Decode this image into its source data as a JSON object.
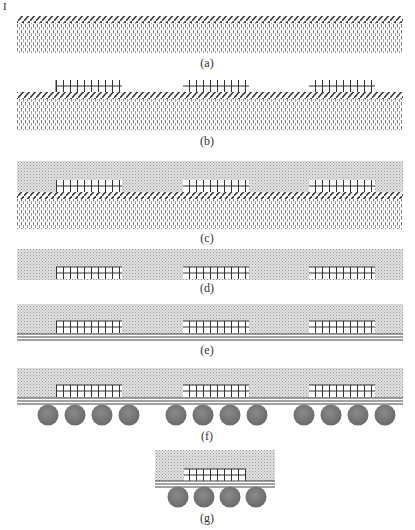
{
  "page_marker": "I",
  "diagram": {
    "type": "process-flow",
    "colors": {
      "hatch": "#3a3a3a",
      "dots": "#8a8a8a",
      "stipple_bg": "#d8d8d8",
      "chip_grid": "#333333",
      "rdl": "#444444",
      "solder_ball": "#777777"
    },
    "panels": [
      {
        "id": "a",
        "label": "(a)",
        "layers": [
          "carrier",
          "adhesive-tape"
        ]
      },
      {
        "id": "b",
        "label": "(b)",
        "layers": [
          "carrier",
          "adhesive-tape",
          "dies"
        ],
        "die_count": 3
      },
      {
        "id": "c",
        "label": "(c)",
        "layers": [
          "carrier",
          "adhesive-tape",
          "dies",
          "mold-compound"
        ],
        "die_count": 3
      },
      {
        "id": "d",
        "label": "(d)",
        "layers": [
          "reconstituted-wafer"
        ],
        "die_count": 3
      },
      {
        "id": "e",
        "label": "(e)",
        "layers": [
          "reconstituted-wafer",
          "redistribution-layer"
        ],
        "die_count": 3
      },
      {
        "id": "f",
        "label": "(f)",
        "layers": [
          "reconstituted-wafer",
          "redistribution-layer",
          "solder-balls"
        ],
        "die_count": 3,
        "balls_per_die": 4
      },
      {
        "id": "g",
        "label": "(g)",
        "layers": [
          "singulated-package"
        ],
        "die_count": 1,
        "balls_per_die": 4
      }
    ]
  }
}
